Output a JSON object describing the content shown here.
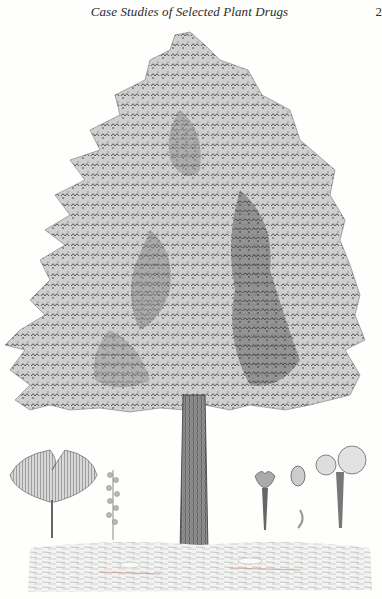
{
  "header": {
    "running_title": "Case Studies of Selected Plant Drugs",
    "page_number": "2"
  },
  "plate": {
    "subject": "Ginkgo tree botanical engraving",
    "specimens": [
      {
        "name": "leaf",
        "label": ""
      },
      {
        "name": "male-catkin",
        "label": ""
      },
      {
        "name": "ovule-stalk",
        "label": ""
      },
      {
        "name": "seed",
        "label": ""
      },
      {
        "name": "seed-kernel",
        "label": ""
      },
      {
        "name": "paired-fruits",
        "label": ""
      }
    ]
  },
  "colors": {
    "ink": "#3a3a3a",
    "ink_dark": "#1f1f1f",
    "paper": "#fefefc",
    "ground_red": "#c98a8a"
  }
}
